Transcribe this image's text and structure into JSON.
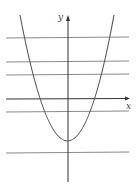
{
  "diagram": {
    "type": "function-graph",
    "axes": {
      "x_label": "x",
      "y_label": "y"
    },
    "curve": {
      "kind": "parabola",
      "opens": "up",
      "vertex_position": "below x-axis on y-axis",
      "color": "#555555"
    },
    "horizontal_lines": {
      "count": 5,
      "positions_relative_to_x_axis": [
        "above",
        "above",
        "above",
        "below",
        "below (under vertex)"
      ],
      "color": "#777777"
    },
    "colors": {
      "axis": "#222222",
      "background": "#ffffff"
    }
  }
}
